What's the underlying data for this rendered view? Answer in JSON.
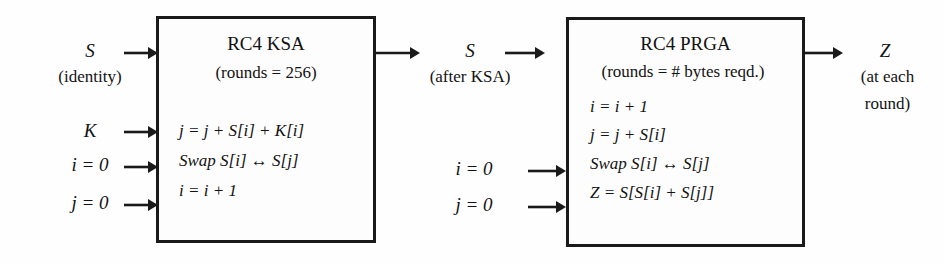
{
  "diagram": {
    "background_color": "#fefefe",
    "stroke_color": "#1a1a1a"
  },
  "inputs_left": {
    "s_label": "S",
    "s_note": "(identity)",
    "k_label": "K",
    "i_init": "i = 0",
    "j_init": "j = 0"
  },
  "ksa_block": {
    "title": "RC4 KSA",
    "rounds": "(rounds = 256)",
    "steps": [
      "j = j + S[i] + K[i]",
      "Swap S[i] ↔ S[j]",
      "i = i + 1"
    ]
  },
  "middle": {
    "s_label": "S",
    "s_note": "(after KSA)",
    "i_init": "i = 0",
    "j_init": "j = 0"
  },
  "prga_block": {
    "title": "RC4 PRGA",
    "rounds": "(rounds = # bytes reqd.)",
    "steps": [
      "i = i + 1",
      "j = j + S[i]",
      "Swap S[i] ↔ S[j]",
      "Z = S[S[i] + S[j]]"
    ]
  },
  "output": {
    "z_label": "Z",
    "z_note_line1": "(at each",
    "z_note_line2": "round)"
  },
  "arrows": {
    "s_into_ksa": "arrow-right",
    "k_into_ksa": "arrow-right",
    "i_into_ksa": "arrow-right",
    "j_into_ksa": "arrow-right",
    "ksa_to_s": "arrow-right",
    "s_into_prga": "arrow-right",
    "i_into_prga": "arrow-right",
    "j_into_prga": "arrow-right",
    "prga_to_z": "arrow-right"
  }
}
